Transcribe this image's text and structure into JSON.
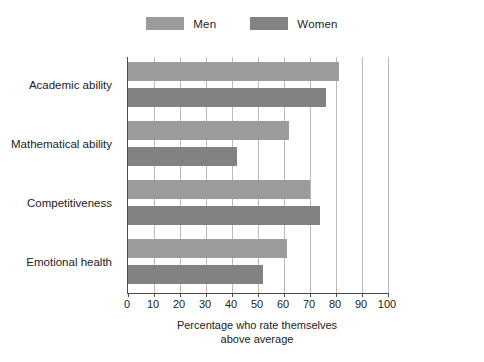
{
  "chart_data": {
    "type": "bar",
    "orientation": "horizontal",
    "title": "",
    "subtitle": "",
    "xlabel": "Percentage who rate themselves above average",
    "xlabel_lines": [
      "Percentage who rate themselves",
      "above average"
    ],
    "ylabel": "",
    "categories": [
      "Academic ability",
      "Mathematical ability",
      "Competitiveness",
      "Emotional health"
    ],
    "series": [
      {
        "name": "Men",
        "color": "#9b9b9b",
        "values": [
          81,
          62,
          70,
          61
        ]
      },
      {
        "name": "Women",
        "color": "#828282",
        "values": [
          76,
          42,
          74,
          52
        ]
      }
    ],
    "xlim": [
      0,
      100
    ],
    "xticks": [
      0,
      10,
      20,
      30,
      40,
      50,
      60,
      70,
      80,
      90,
      100
    ],
    "xticklabels": [
      "0",
      "10",
      "20",
      "30",
      "40",
      "50",
      "60",
      "70",
      "80",
      "90",
      "100"
    ],
    "grid": "vertical",
    "legend_position": "top-center",
    "legend_entries": [
      "Men",
      "Women"
    ]
  },
  "legend": {
    "entries": [
      {
        "label": "Men",
        "swatch_name": "legend-swatch-men"
      },
      {
        "label": "Women",
        "swatch_name": "legend-swatch-women"
      }
    ]
  },
  "colors": {
    "men_bar": "#9b9b9b",
    "women_bar": "#828282",
    "axis": "#4a4a4a",
    "gridline": "#b9b9b9",
    "text": "#1b1b1b",
    "background": "#ffffff"
  }
}
